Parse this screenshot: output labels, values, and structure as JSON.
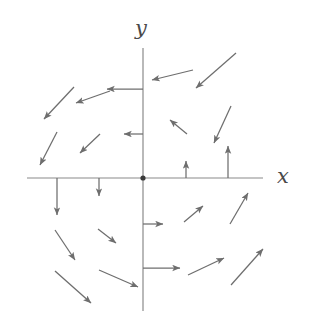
{
  "figure": {
    "title": "",
    "width": 309,
    "height": 329,
    "background_color": "#ffffff",
    "stroke_color": "#6e6e6e",
    "axis_color": "#8a8a8a",
    "label_color": "#4a4a4a"
  },
  "axes": {
    "x_label": "x",
    "y_label": "y",
    "x_axis": {
      "x1": 27,
      "y1": 178,
      "x2": 263,
      "y2": 178
    },
    "y_axis": {
      "x1": 143,
      "y1": 48,
      "x2": 143,
      "y2": 311
    },
    "origin": {
      "x": 143,
      "y": 178,
      "radius": 2.6
    }
  },
  "chart_data": {
    "type": "scatter",
    "subtype": "vector-field",
    "title": "",
    "xlabel": "x",
    "ylabel": "y",
    "origin_marker": true,
    "legend": "none",
    "grid": false,
    "axis_ranges": {
      "xlim": [
        -3,
        3
      ],
      "ylim": [
        -3,
        3
      ]
    },
    "vectors": [
      {
        "id": "q2-a",
        "x1": 74,
        "y1": 87,
        "x2": 44,
        "y2": 119
      },
      {
        "id": "q2-b",
        "x1": 110,
        "y1": 91,
        "x2": 76,
        "y2": 103
      },
      {
        "id": "q2-c",
        "x1": 143,
        "y1": 89,
        "x2": 107,
        "y2": 89
      },
      {
        "id": "q2-d",
        "x1": 57,
        "y1": 132,
        "x2": 40,
        "y2": 165
      },
      {
        "id": "q2-e",
        "x1": 100,
        "y1": 134,
        "x2": 80,
        "y2": 153
      },
      {
        "id": "q2-f",
        "x1": 143,
        "y1": 134,
        "x2": 124,
        "y2": 134
      },
      {
        "id": "q1-a",
        "x1": 236,
        "y1": 53,
        "x2": 196,
        "y2": 88
      },
      {
        "id": "q1-b",
        "x1": 193,
        "y1": 70,
        "x2": 152,
        "y2": 80
      },
      {
        "id": "q1-c",
        "x1": 231,
        "y1": 106,
        "x2": 214,
        "y2": 143
      },
      {
        "id": "q1-d",
        "x1": 187,
        "y1": 134,
        "x2": 170,
        "y2": 120
      },
      {
        "id": "q1-e",
        "x1": 228,
        "y1": 178,
        "x2": 228,
        "y2": 146
      },
      {
        "id": "q1-f",
        "x1": 186,
        "y1": 178,
        "x2": 186,
        "y2": 161
      },
      {
        "id": "q3-a",
        "x1": 57,
        "y1": 178,
        "x2": 57,
        "y2": 215
      },
      {
        "id": "q3-b",
        "x1": 99,
        "y1": 178,
        "x2": 99,
        "y2": 196
      },
      {
        "id": "q3-c",
        "x1": 55,
        "y1": 230,
        "x2": 75,
        "y2": 260
      },
      {
        "id": "q3-d",
        "x1": 98,
        "y1": 229,
        "x2": 116,
        "y2": 243
      },
      {
        "id": "q3-e",
        "x1": 55,
        "y1": 271,
        "x2": 91,
        "y2": 303
      },
      {
        "id": "q3-f",
        "x1": 99,
        "y1": 270,
        "x2": 138,
        "y2": 287
      },
      {
        "id": "q4-a",
        "x1": 143,
        "y1": 224,
        "x2": 163,
        "y2": 224
      },
      {
        "id": "q4-b",
        "x1": 184,
        "y1": 222,
        "x2": 203,
        "y2": 206
      },
      {
        "id": "q4-c",
        "x1": 230,
        "y1": 224,
        "x2": 248,
        "y2": 193
      },
      {
        "id": "q4-d",
        "x1": 143,
        "y1": 268,
        "x2": 180,
        "y2": 268
      },
      {
        "id": "q4-e",
        "x1": 188,
        "y1": 275,
        "x2": 224,
        "y2": 258
      },
      {
        "id": "q4-f",
        "x1": 231,
        "y1": 285,
        "x2": 263,
        "y2": 249
      }
    ]
  }
}
